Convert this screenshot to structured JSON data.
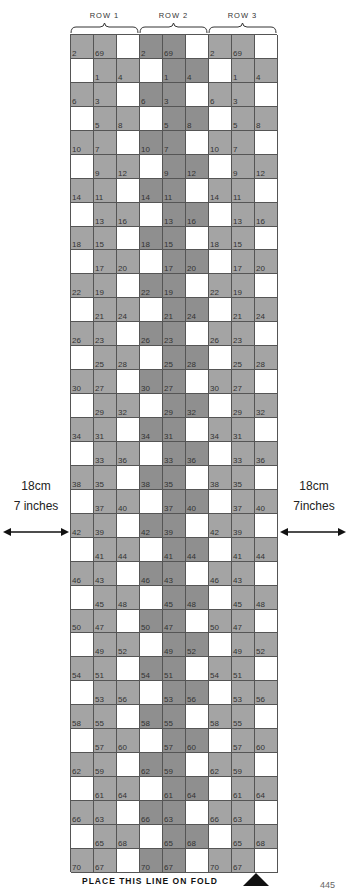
{
  "headers": [
    "ROW 1",
    "ROW 2",
    "ROW 3"
  ],
  "grid": {
    "columns_per_group": 3,
    "groups": 3,
    "rows": [
      [
        "2",
        "69",
        ""
      ],
      [
        "",
        "1",
        "4"
      ],
      [
        "6",
        "3",
        ""
      ],
      [
        "",
        "5",
        "8"
      ],
      [
        "10",
        "7",
        ""
      ],
      [
        "",
        "9",
        "12"
      ],
      [
        "14",
        "11",
        ""
      ],
      [
        "",
        "13",
        "16"
      ],
      [
        "18",
        "15",
        ""
      ],
      [
        "",
        "17",
        "20"
      ],
      [
        "22",
        "19",
        ""
      ],
      [
        "",
        "21",
        "24"
      ],
      [
        "26",
        "23",
        ""
      ],
      [
        "",
        "25",
        "28"
      ],
      [
        "30",
        "27",
        ""
      ],
      [
        "",
        "29",
        "32"
      ],
      [
        "34",
        "31",
        ""
      ],
      [
        "",
        "33",
        "36"
      ],
      [
        "38",
        "35",
        ""
      ],
      [
        "",
        "37",
        "40"
      ],
      [
        "42",
        "39",
        ""
      ],
      [
        "",
        "41",
        "44"
      ],
      [
        "46",
        "43",
        ""
      ],
      [
        "",
        "45",
        "48"
      ],
      [
        "50",
        "47",
        ""
      ],
      [
        "",
        "49",
        "52"
      ],
      [
        "54",
        "51",
        ""
      ],
      [
        "",
        "53",
        "56"
      ],
      [
        "58",
        "55",
        ""
      ],
      [
        "",
        "57",
        "60"
      ],
      [
        "62",
        "59",
        ""
      ],
      [
        "",
        "61",
        "64"
      ],
      [
        "66",
        "63",
        ""
      ],
      [
        "",
        "65",
        "68"
      ],
      [
        "70",
        "67",
        ""
      ]
    ],
    "colors": {
      "shaded_row1_row3": "#a4a4a4",
      "shaded_row2": "#8f8f8f",
      "blank": "#ffffff"
    }
  },
  "measure_left": {
    "cm": "18cm",
    "inches": "7 inches"
  },
  "measure_right": {
    "cm": "18cm",
    "inches": "7inches"
  },
  "footer": {
    "label": "PLACE THIS LINE ON FOLD",
    "icon": "triangle-up-icon"
  },
  "page_number": "445"
}
